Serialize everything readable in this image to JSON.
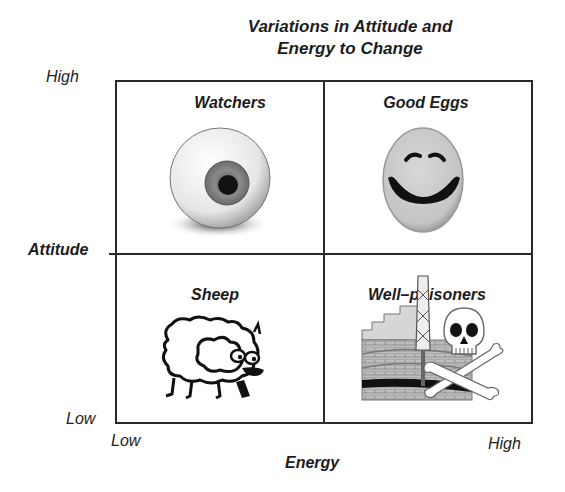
{
  "title": {
    "line1": "Variations in Attitude and",
    "line2": "Energy to Change"
  },
  "y_axis": {
    "title": "Attitude",
    "high_label": "High",
    "low_label": "Low"
  },
  "x_axis": {
    "title": "Energy",
    "low_label": "Low",
    "high_label": "High"
  },
  "quadrants": [
    {
      "position": "top-left",
      "label": "Watchers",
      "attitude": "High",
      "energy": "Low",
      "icon": "eyeball-icon"
    },
    {
      "position": "top-right",
      "label": "Good Eggs",
      "attitude": "High",
      "energy": "High",
      "icon": "smiley-egg-icon"
    },
    {
      "position": "bottom-left",
      "label": "Sheep",
      "attitude": "Low",
      "energy": "Low",
      "icon": "sheep-icon"
    },
    {
      "position": "bottom-right",
      "label": "Well–poisoners",
      "attitude": "Low",
      "energy": "High",
      "icon": "oil-well-skull-icon"
    }
  ],
  "colors": {
    "line": "#2a2a2a",
    "text": "#1c1c1c",
    "background": "#ffffff"
  }
}
